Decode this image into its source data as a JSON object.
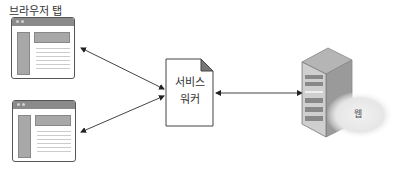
{
  "diagram": {
    "browser_tabs_label": "브라우저 탭",
    "service_worker": {
      "line1": "서비스",
      "line2": "워커"
    },
    "server_cloud_label": "웹",
    "nodes": [
      {
        "id": "browser-tab-1",
        "type": "browser-window"
      },
      {
        "id": "browser-tab-2",
        "type": "browser-window"
      },
      {
        "id": "service-worker",
        "type": "document"
      },
      {
        "id": "web-server",
        "type": "server"
      }
    ],
    "edges": [
      {
        "from": "browser-tab-1",
        "to": "service-worker",
        "bidirectional": true
      },
      {
        "from": "browser-tab-2",
        "to": "service-worker",
        "bidirectional": true
      },
      {
        "from": "service-worker",
        "to": "web-server",
        "bidirectional": true
      }
    ]
  }
}
